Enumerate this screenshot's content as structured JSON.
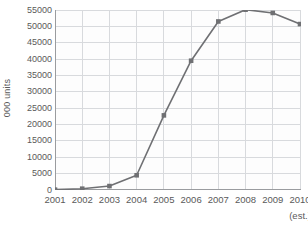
{
  "chart_data": {
    "type": "line",
    "title": "",
    "subtitle": "",
    "xlabel": "",
    "ylabel": "000 units",
    "categories": [
      "2001",
      "2002",
      "2003",
      "2004",
      "2005",
      "2006",
      "2007",
      "2008",
      "2009",
      "2010"
    ],
    "x_tick_labels": [
      "2001",
      "2002",
      "2003",
      "2004",
      "2005",
      "2006",
      "2007",
      "2008",
      "2009",
      "2010"
    ],
    "x_axis_note": "(est.)",
    "x_axis_note_category": "2010",
    "values": [
      100,
      400,
      1200,
      4500,
      22800,
      39500,
      51500,
      55100,
      54100,
      50700
    ],
    "series": [
      {
        "name": "units",
        "values": [
          100,
          400,
          1200,
          4500,
          22800,
          39500,
          51500,
          55100,
          54100,
          50700
        ],
        "line_color": "#6f7073",
        "marker_color": "#6f7073",
        "marker": "square"
      }
    ],
    "ylim": [
      0,
      55000
    ],
    "y_ticks": [
      0,
      5000,
      10000,
      15000,
      20000,
      25000,
      30000,
      35000,
      40000,
      45000,
      50000,
      55000
    ],
    "y_tick_labels": [
      "0",
      "5000",
      "10000",
      "15000",
      "20000",
      "25000",
      "30000",
      "35000",
      "40000",
      "45000",
      "50000",
      "55000"
    ],
    "grid": "both",
    "grid_color": "#d8dadd",
    "axis_color": "#9a9c9f",
    "background_color": "#ffffff",
    "plot_background_color": "#fdfdfd",
    "legend": "none",
    "legend_position": "none"
  }
}
